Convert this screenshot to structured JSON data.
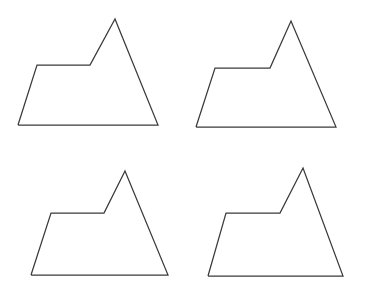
{
  "figure": {
    "type": "shape-array",
    "background_color": "#ffffff",
    "stroke_color": "#3a3a3a",
    "stroke_width": 1.25,
    "fill": "none",
    "canvas": {
      "width": 365,
      "height": 295
    },
    "grid": {
      "rows": 2,
      "columns": 4
    }
  },
  "shapes": [
    {
      "id": "shape-top-left",
      "position": "top-left",
      "vertex_count": 6,
      "points": "18,125 37,65 90,65 115,19 158,125 18,125",
      "vertices": [
        {
          "name": "base-left",
          "x": 18,
          "y": 125
        },
        {
          "name": "ledge-left",
          "x": 37,
          "y": 65
        },
        {
          "name": "ledge-right",
          "x": 90,
          "y": 65
        },
        {
          "name": "apex",
          "x": 115,
          "y": 19
        },
        {
          "name": "base-right",
          "x": 158,
          "y": 125
        }
      ],
      "width": 140,
      "height": 106
    },
    {
      "id": "shape-top-right",
      "position": "top-right",
      "vertex_count": 6,
      "points": "196,127 215,68 270,68 291,21 336,127 196,127",
      "vertices": [
        {
          "name": "base-left",
          "x": 196,
          "y": 127
        },
        {
          "name": "ledge-left",
          "x": 215,
          "y": 68
        },
        {
          "name": "ledge-right",
          "x": 270,
          "y": 68
        },
        {
          "name": "apex",
          "x": 291,
          "y": 21
        },
        {
          "name": "base-right",
          "x": 336,
          "y": 127
        }
      ],
      "width": 140,
      "height": 106
    },
    {
      "id": "shape-bottom-left",
      "position": "bottom-left",
      "vertex_count": 6,
      "points": "31,275 51,213 104,213 125,171 168,275 31,275",
      "vertices": [
        {
          "name": "base-left",
          "x": 31,
          "y": 275
        },
        {
          "name": "ledge-left",
          "x": 51,
          "y": 213
        },
        {
          "name": "ledge-right",
          "x": 104,
          "y": 213
        },
        {
          "name": "apex",
          "x": 125,
          "y": 171
        },
        {
          "name": "base-right",
          "x": 168,
          "y": 275
        }
      ],
      "width": 137,
      "height": 104
    },
    {
      "id": "shape-bottom-right",
      "position": "bottom-right",
      "vertex_count": 6,
      "points": "208,276 226,213 280,213 303,168 343,276 208,276",
      "vertices": [
        {
          "name": "base-left",
          "x": 208,
          "y": 276
        },
        {
          "name": "ledge-left",
          "x": 226,
          "y": 213
        },
        {
          "name": "ledge-right",
          "x": 280,
          "y": 213
        },
        {
          "name": "apex",
          "x": 303,
          "y": 168
        },
        {
          "name": "base-right",
          "x": 343,
          "y": 276
        }
      ],
      "width": 135,
      "height": 108
    }
  ]
}
